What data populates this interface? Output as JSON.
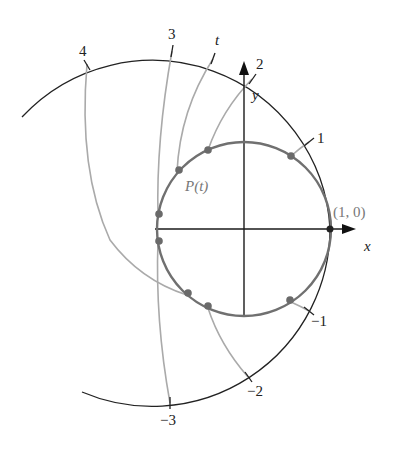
{
  "diagram": {
    "unit_circle": {
      "cx": 244,
      "cy": 229,
      "r": 87,
      "color": "#707070"
    },
    "outer_arc": {
      "cx": 152,
      "cy": 229,
      "r": 178,
      "color": "#222222"
    },
    "axes": {
      "x_label": "x",
      "y_label": "y",
      "color": "#1a1a1a"
    },
    "point_label": "(1, 0)",
    "p_label": "P(t)",
    "ticks": [
      {
        "label": "4",
        "t": 4
      },
      {
        "label": "3",
        "t": 3
      },
      {
        "label": "t",
        "t": 2.5
      },
      {
        "label": "2",
        "t": 2
      },
      {
        "label": "1",
        "t": 1
      },
      {
        "label": "−1",
        "t": -1
      },
      {
        "label": "−2",
        "t": -2
      },
      {
        "label": "−3",
        "t": -3
      }
    ],
    "wrap_color": "#aaaaaa",
    "dot_color": "#6a6a6a"
  }
}
